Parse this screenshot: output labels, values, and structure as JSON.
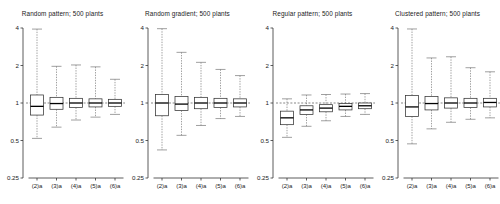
{
  "figure": {
    "width": 500,
    "height": 204,
    "background": "#ffffff",
    "axis_color": "#333333",
    "box_color": "#333333",
    "whisker_color": "#777777",
    "reference_line_color": "#555555"
  },
  "chart_data": {
    "type": "boxplot",
    "title": "",
    "xlabel": "",
    "ylabel": "",
    "yscale": "log",
    "ylim": [
      0.25,
      4
    ],
    "ytick_labels": [
      "4",
      "2",
      "1",
      "0.5",
      "0.25"
    ],
    "ytick_values": [
      4,
      2,
      1,
      0.5,
      0.25
    ],
    "categories": [
      "(2)a",
      "(3)a",
      "(4)a",
      "(5)a",
      "(6)a"
    ],
    "grid": false,
    "legend": "none",
    "reference_line_y": 1,
    "panels": [
      {
        "title": "Random pattern; 500 plants",
        "boxes": [
          {
            "category": "(2)a",
            "whisker_low": 0.52,
            "q1": 0.8,
            "median": 0.94,
            "q3": 1.16,
            "whisker_high": 3.92
          },
          {
            "category": "(3)a",
            "whisker_low": 0.64,
            "q1": 0.89,
            "median": 0.99,
            "q3": 1.11,
            "whisker_high": 1.97
          },
          {
            "category": "(4)a",
            "whisker_low": 0.73,
            "q1": 0.92,
            "median": 1.0,
            "q3": 1.09,
            "whisker_high": 2.02
          },
          {
            "category": "(5)a",
            "whisker_low": 0.77,
            "q1": 0.93,
            "median": 1.0,
            "q3": 1.08,
            "whisker_high": 1.95
          },
          {
            "category": "(6)a",
            "whisker_low": 0.81,
            "q1": 0.94,
            "median": 1.0,
            "q3": 1.07,
            "whisker_high": 1.55
          }
        ]
      },
      {
        "title": "Random gradient; 500 plants",
        "boxes": [
          {
            "category": "(2)a",
            "whisker_low": 0.42,
            "q1": 0.79,
            "median": 1.0,
            "q3": 1.17,
            "whisker_high": 3.95
          },
          {
            "category": "(3)a",
            "whisker_low": 0.55,
            "q1": 0.87,
            "median": 0.98,
            "q3": 1.13,
            "whisker_high": 2.55
          },
          {
            "category": "(4)a",
            "whisker_low": 0.66,
            "q1": 0.9,
            "median": 1.0,
            "q3": 1.11,
            "whisker_high": 2.12
          },
          {
            "category": "(5)a",
            "whisker_low": 0.75,
            "q1": 0.92,
            "median": 1.0,
            "q3": 1.09,
            "whisker_high": 1.86
          },
          {
            "category": "(6)a",
            "whisker_low": 0.78,
            "q1": 0.93,
            "median": 1.0,
            "q3": 1.08,
            "whisker_high": 1.66
          }
        ]
      },
      {
        "title": "Regular pattern; 500 plants",
        "boxes": [
          {
            "category": "(2)a",
            "whisker_low": 0.53,
            "q1": 0.67,
            "median": 0.76,
            "q3": 0.86,
            "whisker_high": 1.08
          },
          {
            "category": "(3)a",
            "whisker_low": 0.65,
            "q1": 0.81,
            "median": 0.88,
            "q3": 0.95,
            "whisker_high": 1.16
          },
          {
            "category": "(4)a",
            "whisker_low": 0.72,
            "q1": 0.85,
            "median": 0.91,
            "q3": 0.97,
            "whisker_high": 1.17
          },
          {
            "category": "(5)a",
            "whisker_low": 0.78,
            "q1": 0.88,
            "median": 0.94,
            "q3": 0.99,
            "whisker_high": 1.18
          },
          {
            "category": "(6)a",
            "whisker_low": 0.81,
            "q1": 0.9,
            "median": 0.95,
            "q3": 1.0,
            "whisker_high": 1.19
          }
        ]
      },
      {
        "title": "Clustered pattern; 500 plants",
        "boxes": [
          {
            "category": "(2)a",
            "whisker_low": 0.47,
            "q1": 0.78,
            "median": 0.93,
            "q3": 1.15,
            "whisker_high": 3.93
          },
          {
            "category": "(3)a",
            "whisker_low": 0.62,
            "q1": 0.88,
            "median": 0.99,
            "q3": 1.13,
            "whisker_high": 2.3
          },
          {
            "category": "(4)a",
            "whisker_low": 0.7,
            "q1": 0.91,
            "median": 1.0,
            "q3": 1.1,
            "whisker_high": 2.35
          },
          {
            "category": "(5)a",
            "whisker_low": 0.74,
            "q1": 0.92,
            "median": 1.0,
            "q3": 1.09,
            "whisker_high": 1.92
          },
          {
            "category": "(6)a",
            "whisker_low": 0.76,
            "q1": 0.93,
            "median": 1.01,
            "q3": 1.09,
            "whisker_high": 1.78
          }
        ]
      }
    ]
  }
}
